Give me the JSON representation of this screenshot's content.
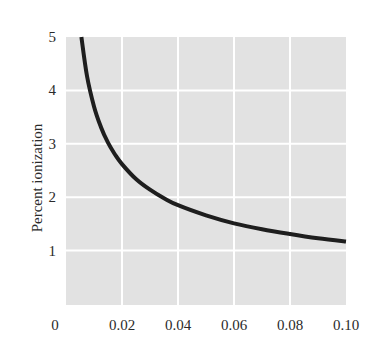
{
  "chart_data": {
    "type": "line",
    "title": "",
    "xlabel": "",
    "ylabel": "Percent ionization",
    "xlim": [
      0,
      0.1
    ],
    "ylim": [
      0,
      5
    ],
    "grid": true,
    "legend": null,
    "x_ticks": [
      "0",
      "0.02",
      "0.04",
      "0.06",
      "0.08",
      "0.10"
    ],
    "y_ticks": [
      "1",
      "2",
      "3",
      "4",
      "5"
    ],
    "series": [
      {
        "name": "Percent ionization",
        "x": [
          0.0055,
          0.0075,
          0.01,
          0.0125,
          0.015,
          0.0175,
          0.02,
          0.025,
          0.03,
          0.035,
          0.04,
          0.05,
          0.06,
          0.07,
          0.08,
          0.09,
          0.1
        ],
        "values": [
          5.0,
          4.27,
          3.7,
          3.31,
          3.02,
          2.8,
          2.62,
          2.34,
          2.14,
          1.98,
          1.85,
          1.66,
          1.51,
          1.4,
          1.31,
          1.23,
          1.17
        ]
      }
    ],
    "colors": {
      "plot_background": "#e2e2e2",
      "gridline": "#ffffff",
      "curve": "#1e1e1e",
      "text": "#2a2a2a"
    }
  }
}
